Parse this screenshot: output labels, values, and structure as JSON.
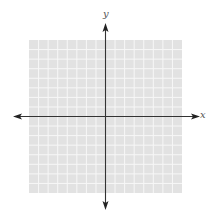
{
  "diagram": {
    "type": "coordinate-plane",
    "x_axis_label": "x",
    "y_axis_label": "y",
    "grid": {
      "columns": 16,
      "rows": 16,
      "cell_size_px": 9.5625,
      "left": 29,
      "top": 40,
      "width": 153,
      "height": 153
    },
    "origin_px": {
      "x": 105.5,
      "y": 116.5
    },
    "colors": {
      "grid_fill": "#e2e2e2",
      "grid_line": "#f7f7f7",
      "axis": "#333333",
      "label": "#555555",
      "background": "#ffffff"
    }
  }
}
